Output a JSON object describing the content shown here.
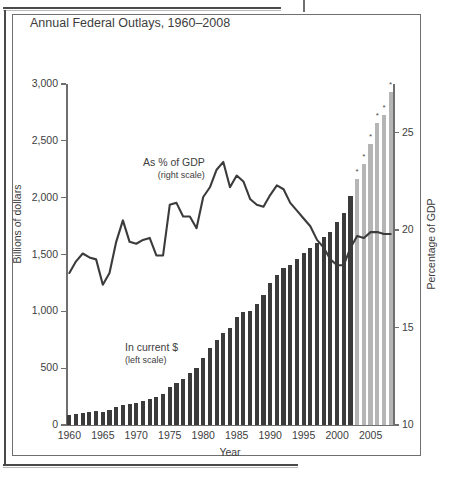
{
  "figure": {
    "label": "FIGURE 14.1",
    "title": "Annual Federal Outlays, 1960–2008"
  },
  "annotations": {
    "gdp_line": {
      "main": "As % of GDP",
      "sub": "(right scale)"
    },
    "bars": {
      "main": "In current $",
      "sub": "(left scale)"
    }
  },
  "axes": {
    "left": {
      "title": "Billions of dollars",
      "ticks": [
        "0",
        "500",
        "1,000",
        "1,500",
        "2,000",
        "2,500",
        "3,000"
      ]
    },
    "right": {
      "title": "Percentage of GDP",
      "ticks": [
        "10",
        "15",
        "20",
        "25"
      ]
    },
    "bottom": {
      "title": "Year",
      "ticks": [
        "1960",
        "1965",
        "1970",
        "1975",
        "1980",
        "1985",
        "1990",
        "1995",
        "2000",
        "2005"
      ]
    }
  },
  "colors": {
    "bar_actual": "#3b3b3b",
    "bar_estimate": "#b5b5b5",
    "line": "#3b3b3b",
    "axis": "#6f6f6f",
    "text": "#3d3d3d",
    "frame": "#6f6f6f"
  },
  "chart_data": {
    "type": "bar",
    "title": "Annual Federal Outlays, 1960–2008",
    "xlabel": "Year",
    "ylabel": "Billions of dollars",
    "y2label": "Percentage of GDP",
    "ylim": [
      0,
      3000
    ],
    "y2lim": [
      10,
      27.5
    ],
    "grid": false,
    "legend": "inline annotations",
    "estimate_marker": "*",
    "estimate_note": "Bars for 2003–2008 are shown in light gray and marked with an asterisk (estimated).",
    "categories": [
      1960,
      1961,
      1962,
      1963,
      1964,
      1965,
      1966,
      1967,
      1968,
      1969,
      1970,
      1971,
      1972,
      1973,
      1974,
      1975,
      1976,
      1977,
      1978,
      1979,
      1980,
      1981,
      1982,
      1983,
      1984,
      1985,
      1986,
      1987,
      1988,
      1989,
      1990,
      1991,
      1992,
      1993,
      1994,
      1995,
      1996,
      1997,
      1998,
      1999,
      2000,
      2001,
      2002,
      2003,
      2004,
      2005,
      2006,
      2007,
      2008
    ],
    "series": [
      {
        "name": "In current $ (left scale)",
        "unit": "billions of dollars",
        "axis": "left",
        "type": "bar",
        "values": [
          92,
          98,
          107,
          111,
          119,
          118,
          135,
          157,
          178,
          184,
          196,
          210,
          231,
          246,
          269,
          332,
          372,
          409,
          459,
          504,
          591,
          678,
          746,
          808,
          852,
          946,
          990,
          1004,
          1065,
          1144,
          1253,
          1324,
          1382,
          1409,
          1462,
          1516,
          1561,
          1601,
          1653,
          1702,
          1789,
          1863,
          2011,
          2160,
          2293,
          2472,
          2655,
          2730,
          2931
        ],
        "estimated_from": 2003
      },
      {
        "name": "As % of GDP (right scale)",
        "unit": "percent of GDP",
        "axis": "right",
        "type": "line",
        "values": [
          17.8,
          18.4,
          18.8,
          18.6,
          18.5,
          17.2,
          17.8,
          19.4,
          20.5,
          19.4,
          19.3,
          19.5,
          19.6,
          18.7,
          18.7,
          21.3,
          21.4,
          20.7,
          20.7,
          20.1,
          21.7,
          22.2,
          23.1,
          23.5,
          22.2,
          22.8,
          22.5,
          21.6,
          21.3,
          21.2,
          21.8,
          22.3,
          22.1,
          21.4,
          21.0,
          20.6,
          20.2,
          19.5,
          19.1,
          18.5,
          18.2,
          18.2,
          19.1,
          19.7,
          19.6,
          19.9,
          19.9,
          19.8,
          19.8
        ]
      }
    ]
  }
}
